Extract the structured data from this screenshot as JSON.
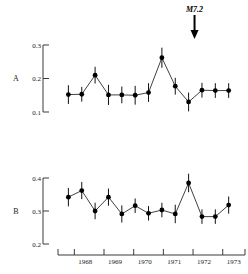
{
  "figure": {
    "annotation": {
      "label": "M7.2",
      "icon": "down-arrow-icon",
      "x_year": 1972.05
    },
    "xaxis": {
      "ticks": [
        1968,
        1969,
        1970,
        1971,
        1972,
        1973
      ],
      "tick_labels": [
        "1968",
        "1969",
        "1970",
        "1971",
        "1972",
        "1973"
      ],
      "range": [
        1967.45,
        1973.75
      ]
    },
    "panels": [
      {
        "id": "A",
        "label": "A",
        "ylim": [
          0.1,
          0.3
        ],
        "yticks": [
          0.1,
          0.2,
          0.3
        ],
        "ytick_labels": [
          "0.1",
          "0.2",
          "0.3"
        ]
      },
      {
        "id": "B",
        "label": "B",
        "ylim": [
          0.2,
          0.4
        ],
        "yticks": [
          0.2,
          0.3,
          0.4
        ],
        "ytick_labels": [
          "0.2",
          "0.3",
          "0.4"
        ]
      }
    ]
  },
  "chart_data": [
    {
      "type": "line",
      "panel": "A",
      "title": "",
      "xlabel": "",
      "ylabel": "",
      "xlim": [
        1967.45,
        1973.75
      ],
      "ylim": [
        0.1,
        0.3
      ],
      "grid": false,
      "legend": "none",
      "x": [
        1967.8,
        1968.25,
        1968.7,
        1969.15,
        1969.6,
        1970.05,
        1970.5,
        1970.95,
        1971.4,
        1971.85,
        1972.3,
        1972.75,
        1973.2
      ],
      "values": [
        0.152,
        0.153,
        0.21,
        0.151,
        0.151,
        0.15,
        0.158,
        0.262,
        0.177,
        0.13,
        0.165,
        0.164,
        0.164
      ],
      "yerr": [
        0.028,
        0.022,
        0.025,
        0.03,
        0.025,
        0.028,
        0.028,
        0.03,
        0.025,
        0.028,
        0.022,
        0.022,
        0.022
      ],
      "markers": "filled-circle",
      "annotations": [
        {
          "label": "M7.2",
          "x": 1972.05,
          "type": "arrow-down"
        }
      ]
    },
    {
      "type": "line",
      "panel": "B",
      "title": "",
      "xlabel": "",
      "ylabel": "",
      "xlim": [
        1967.45,
        1973.75
      ],
      "ylim": [
        0.2,
        0.4
      ],
      "grid": false,
      "legend": "none",
      "x": [
        1967.8,
        1968.25,
        1968.7,
        1969.15,
        1969.6,
        1970.05,
        1970.5,
        1970.95,
        1971.4,
        1971.85,
        1972.3,
        1972.75,
        1973.2
      ],
      "values": [
        0.342,
        0.362,
        0.3,
        0.342,
        0.291,
        0.316,
        0.293,
        0.303,
        0.291,
        0.385,
        0.283,
        0.283,
        0.318
      ],
      "yerr": [
        0.028,
        0.026,
        0.025,
        0.026,
        0.026,
        0.022,
        0.022,
        0.022,
        0.028,
        0.028,
        0.022,
        0.022,
        0.026
      ],
      "markers": "filled-circle",
      "annotations": []
    }
  ]
}
